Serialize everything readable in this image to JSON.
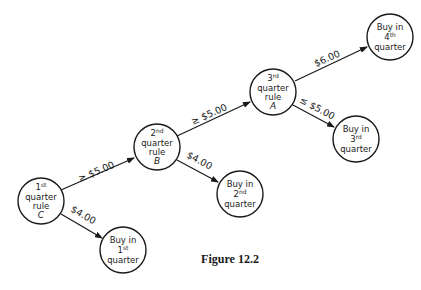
{
  "caption": "Figure 12.2",
  "nodes": {
    "c": {
      "line1": "1",
      "sup": "st",
      "line2": "quarter",
      "line3": "rule",
      "letter": "C"
    },
    "b": {
      "line1": "2",
      "sup": "nd",
      "line2": "quarter",
      "line3": "rule",
      "letter": "B"
    },
    "a": {
      "line1": "3",
      "sup": "rd",
      "line2": "quarter",
      "line3": "rule",
      "letter": "A"
    },
    "buy1": {
      "line1": "Buy in",
      "num": "1",
      "sup": "st",
      "line3": "quarter"
    },
    "buy2": {
      "line1": "Buy in",
      "num": "2",
      "sup": "nd",
      "line3": "quarter"
    },
    "buy3": {
      "line1": "Buy in",
      "num": "3",
      "sup": "rd",
      "line3": "quarter"
    },
    "buy4": {
      "line1": "Buy in",
      "num": "4",
      "sup": "th",
      "line3": "quarter"
    }
  },
  "edges": {
    "c_b": "≥ $5.00",
    "c_buy1": "$4.00",
    "b_a": "≥ $5.00",
    "b_buy2": "$4.00",
    "a_buy4": "$6.00",
    "a_buy3": "≤ $5.00"
  },
  "colors": {
    "ink": "#1a1a1a",
    "background": "#ffffff"
  }
}
